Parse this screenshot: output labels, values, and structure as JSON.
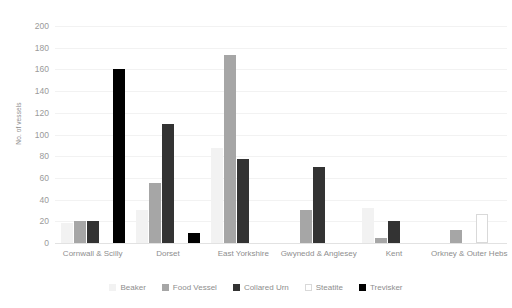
{
  "chart_data": {
    "type": "bar",
    "title": "",
    "xlabel": "",
    "ylabel": "No. of vessels",
    "ylim": [
      0,
      200
    ],
    "ytick_step": 20,
    "yticks": [
      200,
      180,
      160,
      140,
      120,
      100,
      80,
      60,
      40,
      20,
      0
    ],
    "grid": true,
    "legend_position": "bottom",
    "categories": [
      "Cornwall & Scilly",
      "Dorset",
      "East Yorkshire",
      "Gwynedd & Anglesey",
      "Kent",
      "Orkney & Outer Hebs"
    ],
    "series": [
      {
        "name": "Beaker",
        "color": "#f2f2f2",
        "values": [
          18,
          30,
          88,
          0,
          32,
          0
        ]
      },
      {
        "name": "Food Vessel",
        "color": "#a6a6a6",
        "values": [
          20,
          55,
          173,
          30,
          5,
          12
        ]
      },
      {
        "name": "Collared Urn",
        "color": "#333333",
        "values": [
          20,
          110,
          77,
          70,
          20,
          0
        ]
      },
      {
        "name": "Steatite",
        "color": "#ffffff",
        "values": [
          0,
          0,
          0,
          0,
          0,
          27
        ]
      },
      {
        "name": "Trevisker",
        "color": "#000000",
        "values": [
          160,
          9,
          0,
          0,
          0,
          0
        ]
      }
    ]
  },
  "legend": {
    "entries": [
      {
        "label": "Beaker"
      },
      {
        "label": "Food Vessel"
      },
      {
        "label": "Collared Urn"
      },
      {
        "label": "Steatite"
      },
      {
        "label": "Trevisker"
      }
    ]
  }
}
